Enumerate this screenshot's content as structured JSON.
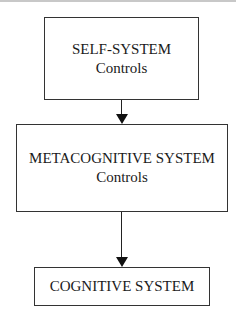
{
  "diagram": {
    "type": "flowchart",
    "direction": "top-to-bottom",
    "nodes": [
      {
        "id": "self",
        "title": "SELF-SYSTEM",
        "subtitle": "Controls"
      },
      {
        "id": "meta",
        "title": "METACOGNITIVE SYSTEM",
        "subtitle": "Controls"
      },
      {
        "id": "cog",
        "title": "COGNITIVE SYSTEM",
        "subtitle": ""
      }
    ],
    "edges": [
      {
        "from": "self",
        "to": "meta"
      },
      {
        "from": "meta",
        "to": "cog"
      }
    ],
    "colors": {
      "border": "#333333",
      "arrow": "#111111",
      "background": "#ffffff",
      "text": "#1a1a1a"
    }
  }
}
